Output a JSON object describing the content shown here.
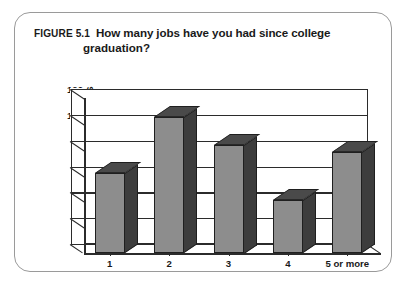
{
  "figure": {
    "label": "FIGURE 5.1",
    "title_line1": "How many jobs have you had since college",
    "title_line2": "graduation?"
  },
  "chart_data": {
    "type": "bar",
    "title": "How many jobs have you had since college graduation?",
    "figure_label": "FIGURE 5.1",
    "categories": [
      "1",
      "2",
      "3",
      "4",
      "5 or more"
    ],
    "values": [
      62,
      105,
      84,
      41,
      78
    ],
    "xlabel": "",
    "ylabel": "SURVEY PARTICIPANTS",
    "ylim": [
      0,
      120
    ],
    "ytick_values": [
      0,
      20,
      40,
      60,
      80,
      100,
      120
    ],
    "ytick_labels": [
      "0",
      "20",
      "40",
      "60",
      "80",
      "100",
      "120"
    ],
    "grid": true,
    "grid_axis": "y",
    "legend": false,
    "style": "3d-column",
    "bar_face_color": "#8d8d8d",
    "bar_side_color": "#3d3d3d",
    "bar_top_color": "#4a4a4a",
    "bar_edge_color": "#1f1f1f",
    "axis_color": "#2b2b2b",
    "plot_background": "#ffffff",
    "border_color": "#9a9a9a"
  }
}
